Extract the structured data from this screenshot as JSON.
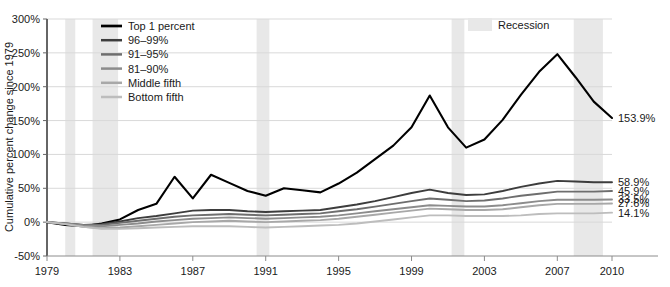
{
  "chart_data": {
    "type": "line",
    "title": "",
    "xlabel": "",
    "ylabel": "Cumulative percent change since 1979",
    "xlim": [
      1979,
      2010
    ],
    "ylim": [
      -50,
      300
    ],
    "ytick_labels": [
      "300%",
      "250%",
      "200%",
      "150%",
      "100%",
      "50%",
      "0%",
      "-50%"
    ],
    "ytick_values": [
      300,
      250,
      200,
      150,
      100,
      50,
      0,
      -50
    ],
    "xtick_labels": [
      "1979",
      "1983",
      "1987",
      "1991",
      "1995",
      "1999",
      "2003",
      "2007",
      "2010"
    ],
    "xtick_values": [
      1979,
      1983,
      1987,
      1991,
      1995,
      1999,
      2003,
      2007,
      2010
    ],
    "grid": true,
    "legend_position": "upper-left",
    "x": [
      1979,
      1980,
      1981,
      1982,
      1983,
      1984,
      1985,
      1986,
      1987,
      1988,
      1989,
      1990,
      1991,
      1992,
      1993,
      1994,
      1995,
      1996,
      1997,
      1998,
      1999,
      2000,
      2001,
      2002,
      2003,
      2004,
      2005,
      2006,
      2007,
      2008,
      2009,
      2010
    ],
    "series": [
      {
        "name": "Top 1 percent",
        "color": "#000000",
        "width": 2.1,
        "end_label": "153.9%",
        "end_value": 153.9,
        "values": [
          0,
          -4,
          -6,
          -2,
          4,
          18,
          27,
          67,
          35,
          70,
          58,
          46,
          39,
          50,
          47,
          44,
          57,
          73,
          93,
          113,
          140,
          187,
          140,
          110,
          122,
          151,
          188,
          222,
          248,
          214,
          178,
          153.9
        ]
      },
      {
        "name": "96–99%",
        "color": "#3d3d3d",
        "width": 1.9,
        "end_label": "58.9%",
        "end_value": 58.9,
        "values": [
          0,
          -2,
          -4,
          -3,
          1,
          6,
          9,
          13,
          17,
          18,
          18,
          16,
          15,
          16,
          17,
          18,
          22,
          26,
          31,
          37,
          43,
          48,
          43,
          40,
          41,
          46,
          52,
          57,
          61,
          60,
          59,
          58.9
        ]
      },
      {
        "name": "91–95%",
        "color": "#6e6e6e",
        "width": 1.9,
        "end_label": "45.9%",
        "end_value": 45.9,
        "values": [
          0,
          -2,
          -4,
          -4,
          -1,
          2,
          5,
          8,
          10,
          11,
          12,
          11,
          10,
          11,
          12,
          13,
          16,
          19,
          23,
          27,
          31,
          35,
          33,
          31,
          32,
          35,
          39,
          42,
          45,
          45,
          45,
          45.9
        ]
      },
      {
        "name": "81–90%",
        "color": "#8c8c8c",
        "width": 1.9,
        "end_label": "33.5%",
        "end_value": 33.5,
        "values": [
          0,
          -2,
          -5,
          -6,
          -4,
          -2,
          1,
          3,
          5,
          6,
          7,
          6,
          5,
          6,
          7,
          8,
          10,
          13,
          16,
          19,
          22,
          25,
          24,
          23,
          23,
          25,
          28,
          31,
          33,
          33,
          33,
          33.5
        ]
      },
      {
        "name": "Middle fifth",
        "color": "#a8a8a8",
        "width": 1.9,
        "end_label": "27.6%",
        "end_value": 27.6,
        "values": [
          0,
          -3,
          -7,
          -9,
          -8,
          -6,
          -4,
          -2,
          0,
          1,
          2,
          1,
          0,
          1,
          2,
          3,
          5,
          8,
          11,
          14,
          17,
          20,
          19,
          18,
          18,
          19,
          22,
          25,
          27,
          27,
          27,
          27.6
        ]
      },
      {
        "name": "Bottom fifth",
        "color": "#bdbdbd",
        "width": 1.9,
        "end_label": "14.1%",
        "end_value": 14.1,
        "values": [
          0,
          -3,
          -7,
          -10,
          -10,
          -9,
          -8,
          -7,
          -6,
          -6,
          -6,
          -7,
          -8,
          -7,
          -6,
          -5,
          -4,
          -2,
          1,
          4,
          7,
          10,
          10,
          9,
          9,
          9,
          10,
          12,
          13,
          13,
          13,
          14.1
        ]
      }
    ],
    "recessions": [
      {
        "start": 1980.0,
        "end": 1980.55
      },
      {
        "start": 1981.5,
        "end": 1982.9
      },
      {
        "start": 1990.5,
        "end": 1991.2
      },
      {
        "start": 2001.2,
        "end": 2001.9
      },
      {
        "start": 2007.9,
        "end": 2009.5
      }
    ],
    "recession_legend_label": "Recession",
    "recession_color": "#e8e8e8",
    "grid_color": "#d9d9d9",
    "axis_color": "#808080"
  }
}
